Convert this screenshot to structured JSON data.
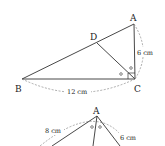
{
  "figure1": {
    "points": {
      "A": {
        "label": "A",
        "x": 134,
        "y": 24
      },
      "B": {
        "label": "B",
        "x": 22,
        "y": 79
      },
      "C": {
        "label": "C",
        "x": 135,
        "y": 79
      },
      "D": {
        "label": "D",
        "x": 97,
        "y": 43
      }
    },
    "lengths": {
      "AC": "6 cm",
      "BC": "12 cm"
    },
    "marks": {
      "right_angle_at": "C",
      "equal_angle_marks": [
        "○",
        "○"
      ]
    }
  },
  "figure2": {
    "apex_label": "A",
    "lengths": {
      "left": "8 cm",
      "right": "6 cm"
    },
    "equal_angle_marks": [
      "○",
      "○"
    ]
  },
  "colors": {
    "line": "#333333",
    "dashed": "#777777",
    "background": "#ffffff"
  }
}
